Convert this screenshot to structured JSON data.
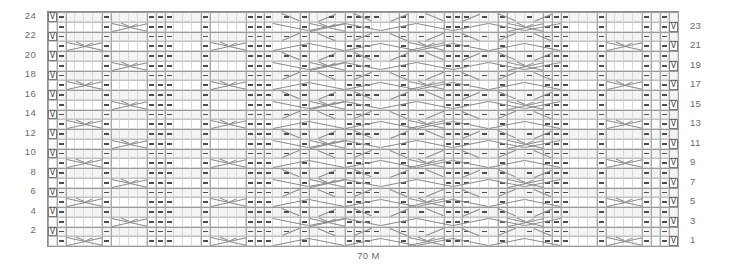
{
  "chart": {
    "title": "",
    "caption": "70 M",
    "columns": 70,
    "rows": 24,
    "grid_color": "#d9d9d9",
    "border_color": "#8e8e8e",
    "symbol_color": "#4d4d4d",
    "cable_color": "#8c8c8c",
    "band_color": "#f4f4f4"
  },
  "row_labels_left": [
    {
      "row": 24,
      "label": "24"
    },
    {
      "row": 22,
      "label": "22"
    },
    {
      "row": 20,
      "label": "20"
    },
    {
      "row": 18,
      "label": "18"
    },
    {
      "row": 16,
      "label": "16"
    },
    {
      "row": 14,
      "label": "14"
    },
    {
      "row": 12,
      "label": "12"
    },
    {
      "row": 10,
      "label": "10"
    },
    {
      "row": 8,
      "label": "8"
    },
    {
      "row": 6,
      "label": "6"
    },
    {
      "row": 4,
      "label": "4"
    },
    {
      "row": 2,
      "label": "2"
    }
  ],
  "row_labels_right": [
    {
      "row": 23,
      "label": "23"
    },
    {
      "row": 21,
      "label": "21"
    },
    {
      "row": 19,
      "label": "19"
    },
    {
      "row": 17,
      "label": "17"
    },
    {
      "row": 15,
      "label": "15"
    },
    {
      "row": 13,
      "label": "13"
    },
    {
      "row": 11,
      "label": "11"
    },
    {
      "row": 9,
      "label": "9"
    },
    {
      "row": 7,
      "label": "7"
    },
    {
      "row": 5,
      "label": "5"
    },
    {
      "row": 3,
      "label": "3"
    },
    {
      "row": 1,
      "label": "1"
    }
  ],
  "legend_symbols": {
    "slip_stitch": "V",
    "purl": "dash",
    "cable_cross": "x-cross",
    "travelling_stitch": "diagonal"
  },
  "chart_data": {
    "type": "heatmap",
    "xlabel": "70 M",
    "ylabel": "",
    "categories": [],
    "grid": {
      "cols": 70,
      "rows": 24
    }
  }
}
